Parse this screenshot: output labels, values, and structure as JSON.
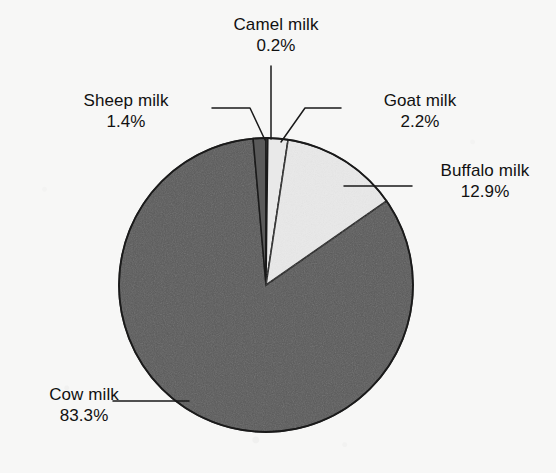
{
  "figure": {
    "background_color": "#f7f7f6",
    "text_color": "#111111",
    "line_color": "#1a1a1a"
  },
  "chart_data": {
    "type": "pie",
    "title": "",
    "subtitle": "",
    "xlabel": "",
    "ylabel": "",
    "legend_position": "none",
    "grid": false,
    "units": "percent",
    "start_angle_deg": 0,
    "direction": "clockwise",
    "center": {
      "x": 266,
      "y": 285
    },
    "radius": 147,
    "categories": [
      "Camel milk",
      "Goat milk",
      "Buffalo milk",
      "Cow milk",
      "Sheep milk"
    ],
    "values": [
      0.2,
      2.2,
      12.9,
      83.3,
      1.4
    ],
    "slices": [
      {
        "name": "camel",
        "label": "Camel milk",
        "value": 0.2,
        "percent_text": "0.2%",
        "color": "#5a5a5a",
        "order": 1
      },
      {
        "name": "goat",
        "label": "Goat milk",
        "value": 2.2,
        "percent_text": "2.2%",
        "color": "#e9e9e9",
        "order": 2
      },
      {
        "name": "buffalo",
        "label": "Buffalo milk",
        "value": 12.9,
        "percent_text": "12.9%",
        "color": "#e9e9e9",
        "order": 3
      },
      {
        "name": "cow",
        "label": "Cow milk",
        "value": 83.3,
        "percent_text": "83.3%",
        "color": "#5a5a5a",
        "order": 4
      },
      {
        "name": "sheep",
        "label": "Sheep milk",
        "value": 1.4,
        "percent_text": "1.4%",
        "color": "#5a5a5a",
        "order": 5
      }
    ],
    "total": 100.0
  },
  "labels": {
    "camel": {
      "name": "Camel milk",
      "percent": "0.2%"
    },
    "sheep": {
      "name": "Sheep milk",
      "percent": "1.4%"
    },
    "goat": {
      "name": "Goat milk",
      "percent": "2.2%"
    },
    "buffalo": {
      "name": "Buffalo milk",
      "percent": "12.9%"
    },
    "cow": {
      "name": "Cow milk",
      "percent": "83.3%"
    }
  }
}
